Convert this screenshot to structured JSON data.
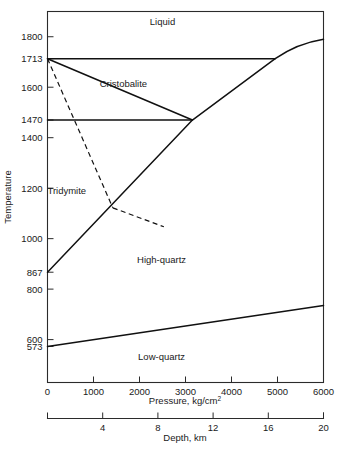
{
  "chart_data": {
    "type": "line",
    "title": "",
    "xlabel": "Pressure, kg/cm2",
    "xlabel_base": "Pressure, kg/cm",
    "xlabel_sup": "2",
    "ylabel": "Temperature",
    "secondary_xlabel": "Depth, km",
    "xlim": [
      0,
      6000
    ],
    "ylim": [
      430,
      1900
    ],
    "grid": false,
    "legend": "none",
    "xticks": [
      0,
      1000,
      2000,
      3000,
      4000,
      5000,
      6000
    ],
    "xticklabels": [
      "0",
      "1000",
      "2000",
      "3000",
      "4000",
      "5000",
      "6000"
    ],
    "yticks": [
      573,
      600,
      800,
      867,
      1000,
      1200,
      1400,
      1470,
      1600,
      1713,
      1800
    ],
    "yticklabels": [
      "573",
      "600",
      "800",
      "867",
      "1000",
      "1200",
      "1400",
      "1470",
      "1600",
      "1713",
      "1800"
    ],
    "depth_ticks": [
      4,
      8,
      12,
      16,
      20
    ],
    "depth_ticklabels": [
      "4",
      "8",
      "12",
      "16",
      "20"
    ],
    "depth_lim": [
      0,
      20
    ],
    "region_labels": [
      {
        "text": "Liquid",
        "x": 2500,
        "y": 1845
      },
      {
        "text": "Cristobalite",
        "x": 1650,
        "y": 1600
      },
      {
        "text": "Tridymite",
        "x": 420,
        "y": 1175
      },
      {
        "text": "High-quartz",
        "x": 2480,
        "y": 905
      },
      {
        "text": "Low-quartz",
        "x": 2480,
        "y": 520
      }
    ],
    "series": [
      {
        "name": "liquidus-melting-curve",
        "style": "solid",
        "points": [
          [
            0,
            1713
          ],
          [
            3150,
            1470
          ],
          [
            4950,
            1713
          ],
          [
            6000,
            1790
          ]
        ]
      },
      {
        "name": "cristobalite-liquid-boundary-1713",
        "style": "solid",
        "points": [
          [
            0,
            1713
          ],
          [
            4950,
            1713
          ]
        ]
      },
      {
        "name": "cristobalite-tridymite-quartz-boundary-1470",
        "style": "solid",
        "points": [
          [
            0,
            1470
          ],
          [
            3150,
            1470
          ]
        ]
      },
      {
        "name": "quartz-melting-curve-lower",
        "style": "solid",
        "points": [
          [
            0,
            867
          ],
          [
            3150,
            1470
          ]
        ]
      },
      {
        "name": "high-low-quartz-inversion",
        "style": "solid",
        "points": [
          [
            0,
            573
          ],
          [
            6000,
            735
          ]
        ]
      },
      {
        "name": "cristobalite-tridymite-metastable",
        "style": "dashed",
        "points": [
          [
            0,
            1713
          ],
          [
            1420,
            1122
          ]
        ]
      },
      {
        "name": "tridymite-quartz-metastable",
        "style": "dashed",
        "points": [
          [
            1420,
            1122
          ],
          [
            2530,
            1047
          ]
        ]
      }
    ]
  }
}
